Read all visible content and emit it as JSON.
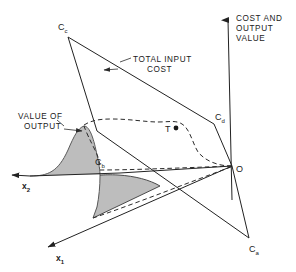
{
  "figure": {
    "type": "diagram",
    "background_color": "#ffffff",
    "line_color": "#222222",
    "surface_fill_color": "#bdbdbd",
    "surface_edge_color": "#555555"
  },
  "axes": {
    "vertical": {
      "label_lines": [
        "COST AND",
        "OUTPUT",
        "VALUE"
      ],
      "arrow": "up",
      "tip": {
        "x": 228,
        "y": 14
      },
      "base": {
        "x": 232,
        "y": 200
      }
    },
    "x1": {
      "label": "x",
      "subscript": "1",
      "arrow": "down-left",
      "tip": {
        "x": 43,
        "y": 249
      },
      "base": {
        "x": 232,
        "y": 166
      }
    },
    "x2": {
      "label": "x",
      "subscript": "2",
      "arrow": "left",
      "tip": {
        "x": 7,
        "y": 175
      },
      "base": {
        "x": 232,
        "y": 166
      }
    }
  },
  "points": [
    {
      "name": "C_c",
      "label": "C",
      "subscript": "c",
      "x": 68,
      "y": 37,
      "label_x": 60,
      "label_y": 28
    },
    {
      "name": "C_d",
      "label": "C",
      "subscript": "d",
      "x": 214,
      "y": 124,
      "label_x": 215,
      "label_y": 118
    },
    {
      "name": "C_a",
      "label": "C",
      "subscript": "a",
      "x": 249,
      "y": 238,
      "label_x": 250,
      "label_y": 250
    },
    {
      "name": "C_b",
      "label": "C",
      "subscript": "b",
      "x": 100,
      "y": 166,
      "label_x": 97,
      "label_y": 163
    },
    {
      "name": "O",
      "label": "O",
      "subscript": "",
      "x": 232,
      "y": 166,
      "label_x": 236,
      "label_y": 170
    },
    {
      "name": "T",
      "label": "T",
      "subscript": "",
      "x": 176,
      "y": 128,
      "label_x": 166,
      "label_y": 131
    }
  ],
  "annotations": [
    {
      "name": "total-input-cost",
      "lines": [
        "TOTAL INPUT",
        "COST"
      ],
      "text_x": 133,
      "text_y": 63,
      "arrow_from": {
        "x": 131,
        "y": 62
      },
      "arrow_to": {
        "x": 107,
        "y": 70
      }
    },
    {
      "name": "value-of-output",
      "lines": [
        "VALUE OF",
        "OUTPUT"
      ],
      "text_x": 18,
      "text_y": 119,
      "arrow_from": {
        "x": 62,
        "y": 128
      },
      "arrow_to": {
        "x": 84,
        "y": 131
      }
    }
  ],
  "legend_note": ""
}
